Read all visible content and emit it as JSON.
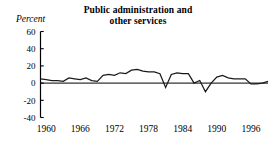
{
  "chart_data": {
    "type": "line",
    "title": "Public administration and other services",
    "title_line1": "Public administration and",
    "title_line2": "other services",
    "ylabel": "Percent",
    "xlabel": "",
    "ylim": [
      -40,
      60
    ],
    "yticks": [
      60,
      40,
      20,
      0,
      -20,
      -40
    ],
    "ytick_labels": [
      "60",
      "40",
      "20",
      "0",
      "-20",
      "-40"
    ],
    "xlim": [
      1959,
      1999
    ],
    "xticks": [
      1960,
      1966,
      1972,
      1978,
      1984,
      1990,
      1996
    ],
    "xtick_labels": [
      "1960",
      "1966",
      "1972",
      "1978",
      "1984",
      "1990",
      "1996"
    ],
    "grid": false,
    "legend": "none",
    "line_color": "#1a1a1a",
    "zero_reference_line": 0,
    "x": [
      1959,
      1960,
      1961,
      1962,
      1963,
      1964,
      1965,
      1966,
      1967,
      1968,
      1969,
      1970,
      1971,
      1972,
      1973,
      1974,
      1975,
      1976,
      1977,
      1978,
      1979,
      1980,
      1981,
      1982,
      1983,
      1984,
      1985,
      1986,
      1987,
      1988,
      1989,
      1990,
      1991,
      1992,
      1993,
      1994,
      1995,
      1996,
      1997,
      1998,
      1999
    ],
    "values": [
      5,
      4,
      3,
      3,
      2,
      6,
      5,
      4,
      6,
      3,
      2,
      9,
      10,
      9,
      12,
      11,
      15,
      16,
      14,
      13,
      13,
      11,
      -5,
      10,
      12,
      11,
      11,
      0,
      3,
      -10,
      0,
      7,
      9,
      6,
      5,
      5,
      5,
      -1,
      -1,
      0,
      2
    ],
    "series": [
      {
        "name": "Public administration and other services",
        "values": [
          5,
          4,
          3,
          3,
          2,
          6,
          5,
          4,
          6,
          3,
          2,
          9,
          10,
          9,
          12,
          11,
          15,
          16,
          14,
          13,
          13,
          11,
          -5,
          10,
          12,
          11,
          11,
          0,
          3,
          -10,
          0,
          7,
          9,
          6,
          5,
          5,
          5,
          -1,
          -1,
          0,
          2
        ]
      }
    ]
  }
}
